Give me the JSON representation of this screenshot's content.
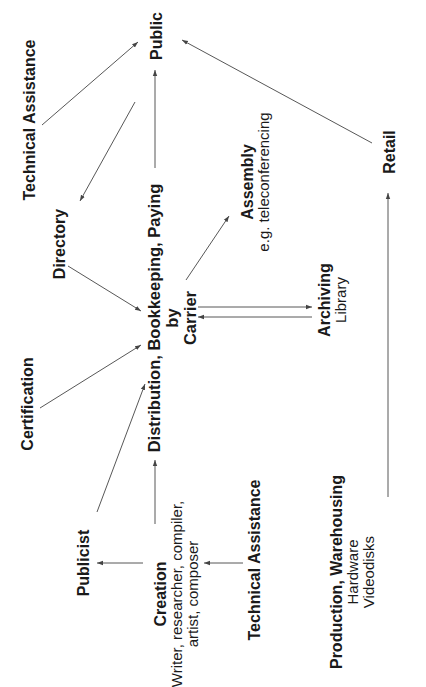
{
  "diagram": {
    "orientation": "rotated-90-ccw",
    "nodes": {
      "public": {
        "title": "Public"
      },
      "tech_assist_top": {
        "title": "Technical Assistance"
      },
      "retail": {
        "title": "Retail"
      },
      "directory": {
        "title": "Directory"
      },
      "hub": {
        "line1": "Distribution, Bookkeeping, Paying",
        "line2": "by",
        "line3": "Carrier"
      },
      "assembly": {
        "title": "Assembly",
        "subtitle": "e.g. teleconferencing"
      },
      "archiving": {
        "title": "Archiving",
        "subtitle": "Library"
      },
      "certification": {
        "title": "Certification"
      },
      "publicist": {
        "title": "Publicist"
      },
      "creation": {
        "title": "Creation",
        "subtitle_line1": "Writer, researcher, compiler,",
        "subtitle_line2": "artist, composer"
      },
      "tech_assist_bottom": {
        "title": "Technical Assistance"
      },
      "production": {
        "title": "Production, Warehousing",
        "subtitle_line1": "Hardware",
        "subtitle_line2": "Videodisks"
      }
    },
    "edges": [
      {
        "from": "Technical Assistance (top)",
        "to": "Public"
      },
      {
        "from": "Public",
        "to": "Directory"
      },
      {
        "from": "Distribution, Bookkeeping, Paying by Carrier",
        "to": "Public"
      },
      {
        "from": "Retail",
        "to": "Public"
      },
      {
        "from": "Directory",
        "to": "Distribution, Bookkeeping, Paying by Carrier"
      },
      {
        "from": "Certification",
        "to": "Distribution, Bookkeeping, Paying by Carrier"
      },
      {
        "from": "Publicist",
        "to": "Distribution, Bookkeeping, Paying by Carrier"
      },
      {
        "from": "Creation",
        "to": "Distribution, Bookkeeping, Paying by Carrier"
      },
      {
        "from": "Carrier",
        "to": "Assembly"
      },
      {
        "from": "Carrier",
        "to": "Archiving"
      },
      {
        "from": "Archiving",
        "to": "Carrier"
      },
      {
        "from": "Creation",
        "to": "Publicist"
      },
      {
        "from": "Technical Assistance (bottom)",
        "to": "Creation"
      },
      {
        "from": "Production, Warehousing",
        "to": "Retail"
      }
    ],
    "colors": {
      "background": "#ffffff",
      "text": "#1a1a1a",
      "line": "#444444"
    }
  }
}
